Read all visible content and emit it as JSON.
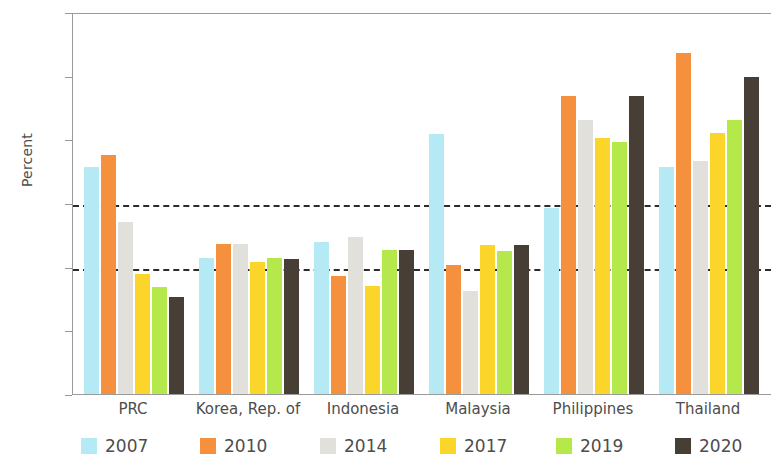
{
  "chart_data": {
    "type": "bar",
    "title": "",
    "xlabel": "",
    "ylabel": "Percent",
    "ylim": [
      0,
      300
    ],
    "yticks": [
      0,
      50,
      100,
      150,
      200,
      250,
      300
    ],
    "gridlines": [
      100,
      150
    ],
    "grid": "dashed horizontal reference lines at 100 and 150",
    "legend_position": "bottom",
    "categories": [
      "PRC",
      "Korea, Rep. of",
      "Indonesia",
      "Malaysia",
      "Philippines",
      "Thailand"
    ],
    "series": [
      {
        "name": "2007",
        "color": "#b5eaf5",
        "values": [
          178,
          107,
          119,
          204,
          146,
          178
        ]
      },
      {
        "name": "2010",
        "color": "#f5903f",
        "values": [
          188,
          118,
          93,
          101,
          234,
          268
        ]
      },
      {
        "name": "2014",
        "color": "#e2e0db",
        "values": [
          135,
          118,
          123,
          81,
          215,
          183
        ]
      },
      {
        "name": "2017",
        "color": "#fbd52a",
        "values": [
          94,
          104,
          85,
          117,
          201,
          205
        ]
      },
      {
        "name": "2019",
        "color": "#b5e84a",
        "values": [
          84,
          107,
          113,
          112,
          198,
          215
        ]
      },
      {
        "name": "2020",
        "color": "#473f36",
        "values": [
          76,
          106,
          113,
          117,
          234,
          249
        ]
      }
    ]
  },
  "axis": {
    "y_tick_labels": [
      "0",
      "50",
      "100",
      "150",
      "200",
      "250",
      "300"
    ],
    "y_title": "Percent"
  },
  "legend": {
    "items": [
      {
        "label": "2007",
        "color": "#b5eaf5"
      },
      {
        "label": "2010",
        "color": "#f5903f"
      },
      {
        "label": "2014",
        "color": "#e2e0db"
      },
      {
        "label": "2017",
        "color": "#fbd52a"
      },
      {
        "label": "2019",
        "color": "#b5e84a"
      },
      {
        "label": "2020",
        "color": "#473f36"
      }
    ]
  }
}
